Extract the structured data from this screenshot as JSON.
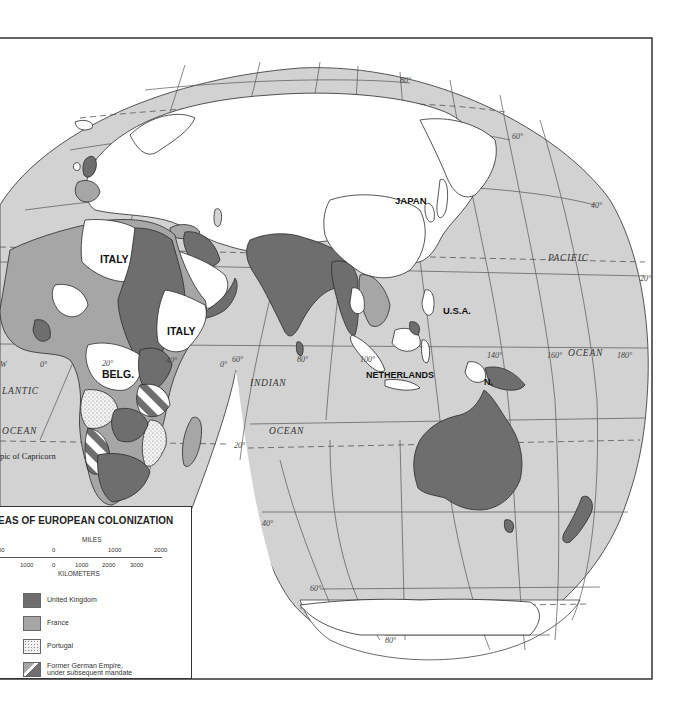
{
  "map": {
    "title_visible": "EAS OF EUROPEAN COLONIZATION",
    "colors": {
      "ocean": "#d2d2d2",
      "land_uncolonized": "#ffffff",
      "united_kingdom": "#6e6e6e",
      "france": "#a6a6a6",
      "portugal": "#ececec",
      "border": "#2a2a2a",
      "graticule": "#555555"
    },
    "country_labels": [
      {
        "id": "italy-libya",
        "text": "ITALY"
      },
      {
        "id": "italy-east-africa",
        "text": "ITALY"
      },
      {
        "id": "belgium",
        "text": "BELG."
      },
      {
        "id": "japan",
        "text": "JAPAN"
      },
      {
        "id": "usa",
        "text": "U.S.A."
      },
      {
        "id": "netherlands",
        "text": "NETHERLANDS"
      },
      {
        "id": "netherlands-ng",
        "text": "N."
      }
    ],
    "ocean_labels": [
      {
        "id": "atlantic",
        "text": "LANTIC"
      },
      {
        "id": "atlantic-ocean",
        "text": "OCEAN"
      },
      {
        "id": "indian",
        "text": "INDIAN"
      },
      {
        "id": "indian-ocean",
        "text": "OCEAN"
      },
      {
        "id": "pacific",
        "text": "PACIFIC"
      },
      {
        "id": "pacific-ocean",
        "text": "OCEAN"
      }
    ],
    "line_labels": {
      "tropic_capricorn": "pic of Capricorn"
    },
    "graticule_labels": {
      "lat_80n": "80°",
      "lat_60n": "60°",
      "lat_40n": "40°",
      "lat_20n": "20°",
      "lat_0_africa": "0°",
      "lat_0_east": "0°",
      "lat_20s": "20°",
      "lat_40s": "40°",
      "lat_60s": "60°",
      "lat_80s": "80°",
      "lon_0": "0°",
      "lon_20": "20°",
      "lon_40": "40°",
      "lon_60": "60°",
      "lon_80": "80°",
      "lon_100": "100°",
      "lon_140": "140°",
      "lon_160": "160°",
      "lon_180": "180°",
      "lon_w": "W"
    }
  },
  "legend": {
    "title": "EAS OF EUROPEAN COLONIZATION",
    "scale": {
      "miles_label": "MILES",
      "km_label": "KILOMETERS",
      "miles_ticks": [
        "00",
        "0",
        "1000",
        "2000"
      ],
      "km_ticks": [
        "1000",
        "0",
        "1000",
        "2000",
        "3000"
      ]
    },
    "items": [
      {
        "label": "United Kingdom",
        "color": "#6e6e6e"
      },
      {
        "label": "France",
        "color": "#a6a6a6"
      },
      {
        "label": "Portugal",
        "color": "#ececec"
      },
      {
        "label": "Former German Empire,",
        "label2": "under subsequent mandate"
      }
    ]
  }
}
